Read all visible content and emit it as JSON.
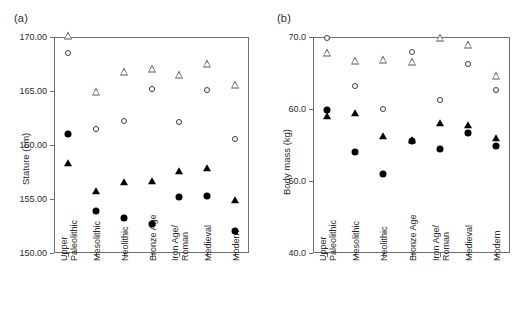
{
  "figure": {
    "background": "#ffffff",
    "marker_colors": {
      "filled": "#000000",
      "open_outline": "#3a3a3a"
    }
  },
  "panels": [
    {
      "key": "a",
      "label": "(a)",
      "chart_index": 0
    },
    {
      "key": "b",
      "label": "(b)",
      "chart_index": 1
    }
  ],
  "chart_data": [
    {
      "type": "scatter",
      "panel": "(a)",
      "title": "",
      "xlabel": "",
      "ylabel": "Stature (cm)",
      "ylim": [
        150.0,
        170.0
      ],
      "yticks": [
        150.0,
        155.0,
        160.0,
        165.0,
        170.0
      ],
      "ytick_labels": [
        "150.00",
        "155.00",
        "160.00",
        "165.00",
        "170.00"
      ],
      "grid": false,
      "legend": "none",
      "categories": [
        "Upper\nPaleolithic",
        "Mesolithic",
        "Neolithic",
        "Bronze Age",
        "Iron Age/\nRoman",
        "Medieval",
        "Modern"
      ],
      "series": [
        {
          "name": "open-triangle",
          "marker": "open-triangle",
          "values": [
            170.1,
            164.9,
            166.8,
            167.0,
            166.5,
            167.5,
            165.6
          ]
        },
        {
          "name": "open-circle",
          "marker": "open-circle",
          "values": [
            168.5,
            161.5,
            162.2,
            165.2,
            162.1,
            165.1,
            160.6
          ]
        },
        {
          "name": "filled-triangle",
          "marker": "filled-triangle",
          "values": [
            158.3,
            155.7,
            156.6,
            156.7,
            157.6,
            157.9,
            154.9
          ]
        },
        {
          "name": "filled-circle",
          "marker": "filled-circle",
          "values": [
            161.0,
            153.9,
            153.2,
            152.7,
            155.2,
            155.3,
            152.0
          ]
        }
      ]
    },
    {
      "type": "scatter",
      "panel": "(b)",
      "title": "",
      "xlabel": "",
      "ylabel": "Body mass (kg)",
      "ylim": [
        40.0,
        70.0
      ],
      "yticks": [
        40.0,
        50.0,
        60.0,
        70.0
      ],
      "ytick_labels": [
        "40.0",
        "50.0",
        "60.0",
        "70.0"
      ],
      "grid": false,
      "legend": "none",
      "categories": [
        "Upper\nPaleolithic",
        "Mesolithic",
        "Neolithic",
        "Bronze Age",
        "Iron Age/\nRoman",
        "Medieval",
        "Modern"
      ],
      "series": [
        {
          "name": "open-circle",
          "marker": "open-circle",
          "values": [
            69.9,
            63.2,
            60.0,
            67.9,
            61.2,
            66.3,
            62.6
          ]
        },
        {
          "name": "open-triangle",
          "marker": "open-triangle",
          "values": [
            67.8,
            66.6,
            66.8,
            66.5,
            69.8,
            68.9,
            64.6
          ]
        },
        {
          "name": "filled-triangle",
          "marker": "filled-triangle",
          "values": [
            59.0,
            59.4,
            56.2,
            55.7,
            58.0,
            57.8,
            56.0
          ]
        },
        {
          "name": "filled-circle",
          "marker": "filled-circle",
          "values": [
            59.8,
            54.0,
            51.0,
            55.5,
            54.4,
            56.6,
            54.9
          ]
        }
      ]
    }
  ]
}
